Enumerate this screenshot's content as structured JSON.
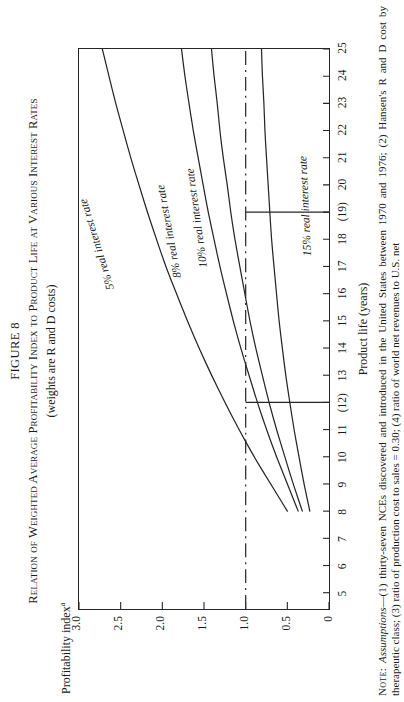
{
  "figure": {
    "number": "FIGURE 8",
    "title": "Relation of Weighted Average Profitability Index to Product Life at Various Interest Rates",
    "subtitle": "(weights are R and D costs)"
  },
  "note": {
    "label": "Note:",
    "lead": "Assumptions",
    "text": "—(1) thirty-seven NCEs discovered and introduced in the United States between 1970 and 1976; (2) Hansen's R and D cost by therapeutic class; (3) ratio of production cost to sales = 0.30; (4) ratio of world net revenues to U.S. net",
    "clipped_line": "revenues = 1.75."
  },
  "chart_data": {
    "type": "line",
    "title": "Relation of Weighted Average Profitability Index to Product Life at Various Interest Rates",
    "subtitle": "(weights are R and D costs)",
    "xlabel": "Product life (years)",
    "ylabel": "Profitability index",
    "ylabel_superscript": "a",
    "xlim": [
      4.4,
      25
    ],
    "ylim": [
      0,
      3.0
    ],
    "xticks": [
      5,
      6,
      7,
      8,
      9,
      10,
      11,
      12,
      13,
      14,
      15,
      16,
      17,
      18,
      19,
      20,
      21,
      22,
      23,
      24,
      25
    ],
    "xticklabels": [
      "5",
      "6",
      "7",
      "8",
      "9",
      "10",
      "11",
      "(12)",
      "13",
      "14",
      "15",
      "16",
      "17",
      "18",
      "(19)",
      "20",
      "21",
      "22",
      "23",
      "24",
      "25"
    ],
    "yticks": [
      0,
      0.5,
      1.0,
      1.5,
      2.0,
      2.5,
      3.0
    ],
    "yticklabels": [
      "0",
      "0.5",
      "1.0",
      "1.5",
      "2.0",
      "2.5",
      "3.0"
    ],
    "grid": false,
    "legend_position": "inline-curve-labels",
    "reference_lines": [
      {
        "name": "breakeven",
        "orientation": "horizontal",
        "y": 1.0,
        "style": "dash-dot",
        "label": ""
      },
      {
        "name": "life-12",
        "orientation": "vertical",
        "x": 12,
        "style": "solid",
        "y_from": 0,
        "y_to": 1.0
      },
      {
        "name": "life-19",
        "orientation": "vertical",
        "x": 19,
        "style": "solid",
        "y_from": 0,
        "y_to": 1.0
      }
    ],
    "series": [
      {
        "name": "5% real interest rate",
        "label": "5% real interest rate",
        "x": [
          8.0,
          9,
          10,
          11,
          12,
          13,
          14,
          15,
          16,
          17,
          18,
          19,
          20,
          21,
          22,
          23,
          24,
          25
        ],
        "y": [
          0.5,
          0.7,
          0.9,
          1.08,
          1.25,
          1.41,
          1.56,
          1.7,
          1.83,
          1.96,
          2.07,
          2.18,
          2.28,
          2.38,
          2.47,
          2.56,
          2.64,
          2.72
        ]
      },
      {
        "name": "8% real interest rate",
        "label": "8% real interest rate",
        "x": [
          8.0,
          9,
          10,
          11,
          12,
          13,
          14,
          15,
          16,
          17,
          18,
          19,
          20,
          21,
          22,
          23,
          24,
          25
        ],
        "y": [
          0.37,
          0.5,
          0.63,
          0.75,
          0.86,
          0.96,
          1.06,
          1.15,
          1.23,
          1.31,
          1.38,
          1.45,
          1.51,
          1.57,
          1.63,
          1.68,
          1.73,
          1.77
        ]
      },
      {
        "name": "10% real interest rate",
        "label": "10% real interest rate",
        "x": [
          8.0,
          9,
          10,
          11,
          12,
          13,
          14,
          15,
          16,
          17,
          18,
          19,
          20,
          21,
          22,
          23,
          24,
          25
        ],
        "y": [
          0.32,
          0.43,
          0.53,
          0.63,
          0.72,
          0.8,
          0.88,
          0.95,
          1.01,
          1.07,
          1.13,
          1.18,
          1.22,
          1.27,
          1.31,
          1.34,
          1.38,
          1.41
        ]
      },
      {
        "name": "15% real interest rate",
        "label": "15% real interest rate",
        "x": [
          8.0,
          9,
          10,
          11,
          12,
          13,
          14,
          15,
          16,
          17,
          18,
          19,
          20,
          21,
          22,
          23,
          24,
          25
        ],
        "y": [
          0.23,
          0.3,
          0.36,
          0.42,
          0.47,
          0.52,
          0.56,
          0.6,
          0.63,
          0.66,
          0.69,
          0.71,
          0.73,
          0.75,
          0.77,
          0.78,
          0.8,
          0.81
        ]
      }
    ]
  }
}
